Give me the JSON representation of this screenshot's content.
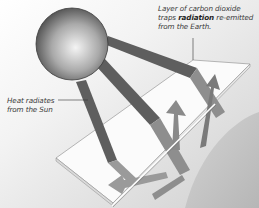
{
  "diagram": {
    "labels": {
      "co2_layer": {
        "line1": "Layer of carbon dioxide",
        "line2_pre": "traps ",
        "line2_bold": "radiation",
        "line2_post": " re-emitted",
        "line3": "from the Earth."
      },
      "heat": {
        "line1": "Heat radiates",
        "line2": "from the Sun"
      }
    },
    "elements": {
      "sun": "sphere",
      "rays_from_sun": 3,
      "co2_layer": "translucent slab",
      "earth": "curved surface",
      "reemitted_arrows": 4
    },
    "colors": {
      "background_light": "#f2f2f2",
      "background_dark": "#cfcfcf",
      "ray_dark": "#5e5e5e",
      "ray_light": "#9a9a9a",
      "earth": "#c4c4c4",
      "slab": "#fafafa"
    }
  }
}
